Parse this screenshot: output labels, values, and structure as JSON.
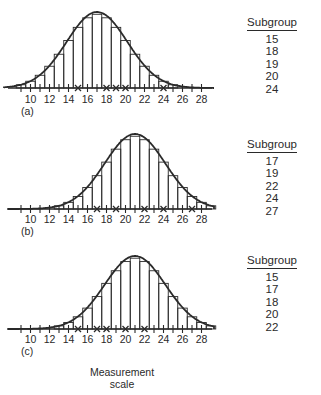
{
  "chart_data": [
    {
      "type": "bar",
      "panel": "(a)",
      "description": "Histogram with fitted smooth distribution curve; x marks on axis indicate subgroup values",
      "xlabel": "",
      "ylabel": "",
      "x_ticks": [
        10,
        12,
        14,
        16,
        18,
        20,
        22,
        24,
        26,
        28
      ],
      "xlim": [
        8,
        29
      ],
      "mean": 17,
      "sd": 3.2,
      "bar_range": [
        9,
        26
      ],
      "marked_values": [
        15,
        18,
        19,
        20,
        24
      ],
      "legend_title": "Subgroup",
      "legend_values": [
        "15",
        "18",
        "19",
        "20",
        "24"
      ],
      "grid": false
    },
    {
      "type": "bar",
      "panel": "(b)",
      "description": "Histogram with fitted smooth distribution curve; x marks on axis indicate subgroup values",
      "xlabel": "",
      "ylabel": "",
      "x_ticks": [
        10,
        12,
        14,
        16,
        18,
        20,
        22,
        24,
        26,
        28
      ],
      "xlim": [
        8,
        29
      ],
      "mean": 21,
      "sd": 3.2,
      "bar_range": [
        13,
        29
      ],
      "marked_values": [
        17,
        19,
        22,
        24,
        27
      ],
      "legend_title": "Subgroup",
      "legend_values": [
        "17",
        "19",
        "22",
        "24",
        "27"
      ],
      "grid": false
    },
    {
      "type": "bar",
      "panel": "(c)",
      "description": "Histogram with fitted smooth distribution curve; x marks on axis indicate subgroup values",
      "xlabel": "Measurement scale",
      "ylabel": "",
      "x_ticks": [
        10,
        12,
        14,
        16,
        18,
        20,
        22,
        24,
        26,
        28
      ],
      "xlim": [
        8,
        29
      ],
      "mean": 21,
      "sd": 3.2,
      "bar_range": [
        13,
        29
      ],
      "marked_values": [
        15,
        17,
        18,
        20,
        22
      ],
      "legend_title": "Subgroup",
      "legend_values": [
        "15",
        "17",
        "18",
        "20",
        "22"
      ],
      "grid": false
    }
  ],
  "panels": [
    {
      "label": "(a)",
      "legend": {
        "title": "Subgroup",
        "values": [
          "15",
          "18",
          "19",
          "20",
          "24"
        ]
      }
    },
    {
      "label": "(b)",
      "legend": {
        "title": "Subgroup",
        "values": [
          "17",
          "19",
          "22",
          "24",
          "27"
        ]
      }
    },
    {
      "label": "(c)",
      "legend": {
        "title": "Subgroup",
        "values": [
          "15",
          "17",
          "18",
          "20",
          "22"
        ]
      }
    }
  ],
  "caption": {
    "line1": "Measurement",
    "line2": "scale"
  },
  "colors": {
    "ink": "#2a2a2a",
    "background": "#ffffff"
  }
}
